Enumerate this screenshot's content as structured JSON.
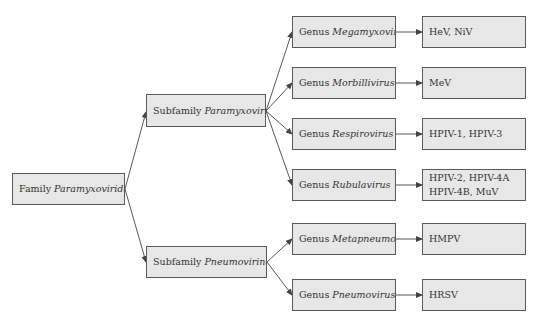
{
  "diagram": {
    "colors": {
      "box_fill": "#e7e7e7",
      "box_border": "#5a5a5a",
      "text": "#333333",
      "arrow": "#444444"
    },
    "family": {
      "prefix": "Family",
      "name": "Paramyxoviridae"
    },
    "subfamilies": [
      {
        "prefix": "Subfamily",
        "name": "Paramyxovirinae",
        "genera": [
          {
            "prefix": "Genus",
            "name": "Megamyxovirus",
            "viruses": [
              "HeV, NiV"
            ]
          },
          {
            "prefix": "Genus",
            "name": "Morbillivirus",
            "viruses": [
              "MeV"
            ]
          },
          {
            "prefix": "Genus",
            "name": "Respirovirus",
            "viruses": [
              "HPIV-1, HPIV-3"
            ]
          },
          {
            "prefix": "Genus",
            "name": "Rubulavirus",
            "viruses": [
              "HPIV-2, HPIV-4A",
              "HPIV-4B, MuV"
            ]
          }
        ]
      },
      {
        "prefix": "Subfamily",
        "name": "Pneumovirinae",
        "genera": [
          {
            "prefix": "Genus",
            "name": "Metapneumovirus",
            "viruses": [
              "HMPV"
            ]
          },
          {
            "prefix": "Genus",
            "name": "Pneumovirus",
            "viruses": [
              "HRSV"
            ]
          }
        ]
      }
    ]
  }
}
